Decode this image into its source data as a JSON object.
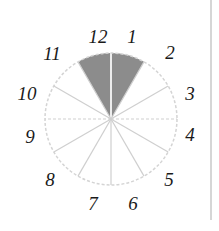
{
  "diagram": {
    "type": "clock-sector-diagram",
    "sectors_total": 12,
    "shaded_sectors": [
      {
        "from": 11,
        "to": 12
      },
      {
        "from": 12,
        "to": 1
      }
    ],
    "labels": [
      "12",
      "1",
      "2",
      "3",
      "4",
      "5",
      "6",
      "7",
      "8",
      "9",
      "10",
      "11"
    ],
    "colors": {
      "shaded": "#8c8c8c",
      "dividers": "#cfcfcf",
      "outline": "#d4d4d4",
      "labels": "#1a1a1a"
    }
  }
}
